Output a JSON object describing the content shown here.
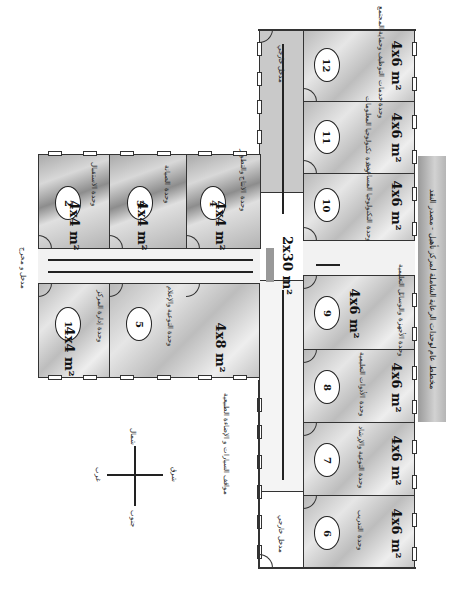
{
  "title_banner": "مخطط عام لوحدات الرعاية الشاملة لمركز تأهيل - مصدر النقد",
  "corridor": {
    "main_label": "2x30 m²",
    "top_label": "مدخل خارجي",
    "bottom_label": "مدخل خارجي",
    "side_label": "مدخل و مخرج",
    "outside_label": "مواقف السيارات و الإضاءة الطبيعية"
  },
  "compass": {
    "north": "شمال",
    "south": "جنوب",
    "east": "شرق",
    "west": "غرب"
  },
  "rooms": [
    {
      "number": "1",
      "area": "4x4 m²",
      "label": "وحدة إدارة المركز"
    },
    {
      "number": "2",
      "area": "4x4 m²",
      "label": "وحدة الاستقبال"
    },
    {
      "number": "3",
      "area": "4x4 m²",
      "label": "وحدة الصيانة"
    },
    {
      "number": "4",
      "area": "4x4 m²",
      "label": "وحدة الانتاج والتطوير"
    },
    {
      "number": "5",
      "area": "4x8 m²",
      "label": "وحدة التوعية والإعلام"
    },
    {
      "number": "6",
      "area": "4x6 m²",
      "label": "وحدة التدريب"
    },
    {
      "number": "7",
      "area": "4x6 m²",
      "label": "وحدة التوعية والإرشاد"
    },
    {
      "number": "8",
      "area": "4x6 m²",
      "label": "وحدة الأدوات التعليمية"
    },
    {
      "number": "9",
      "area": "4x6 m²",
      "label": "وحدة الأجهزة والوسائل التعليمية"
    },
    {
      "number": "10",
      "area": "4x6 m²",
      "label": "وحدة التكنولوجيا المساعدة"
    },
    {
      "number": "11",
      "area": "4x6 m²",
      "label": "وحدة تكنولوجيا المعلومات"
    },
    {
      "number": "12",
      "area": "4x6 m²",
      "label": "وحدة خدمات التوظيف وحماية المجتمع"
    }
  ]
}
